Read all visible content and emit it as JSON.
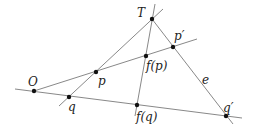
{
  "diagram": {
    "title": "",
    "stroke_color": "#7a7a7a",
    "point_color": "#111111",
    "label_color": "#222222",
    "labels": {
      "T": "T",
      "p_prime": "p′",
      "f_p": "f(p)",
      "p": "p",
      "O": "O",
      "q": "q",
      "f_q": "f(q)",
      "q_prime": "q′",
      "e": "e"
    },
    "points": [
      {
        "id": "T",
        "x": 152,
        "y": 19
      },
      {
        "id": "p_prime",
        "x": 173,
        "y": 47
      },
      {
        "id": "f_p",
        "x": 146,
        "y": 56
      },
      {
        "id": "p",
        "x": 96,
        "y": 72
      },
      {
        "id": "O",
        "x": 34,
        "y": 91
      },
      {
        "id": "q",
        "x": 69,
        "y": 97
      },
      {
        "id": "f_q",
        "x": 137,
        "y": 105
      },
      {
        "id": "q_prime",
        "x": 226,
        "y": 116
      }
    ],
    "lines": [
      {
        "id": "line-O-p-fp-pprime",
        "through": [
          "O",
          "p",
          "f_p",
          "p_prime"
        ]
      },
      {
        "id": "line-O-q-fq-qprime",
        "through": [
          "O",
          "q",
          "f_q",
          "q_prime"
        ]
      },
      {
        "id": "line-T-p-q",
        "through": [
          "T",
          "p",
          "q"
        ]
      },
      {
        "id": "line-T-fp-fq",
        "through": [
          "T",
          "f_p",
          "f_q"
        ]
      },
      {
        "id": "line-e-T-pprime-qprime",
        "through": [
          "T",
          "p_prime",
          "q_prime"
        ],
        "label": "e"
      }
    ]
  }
}
